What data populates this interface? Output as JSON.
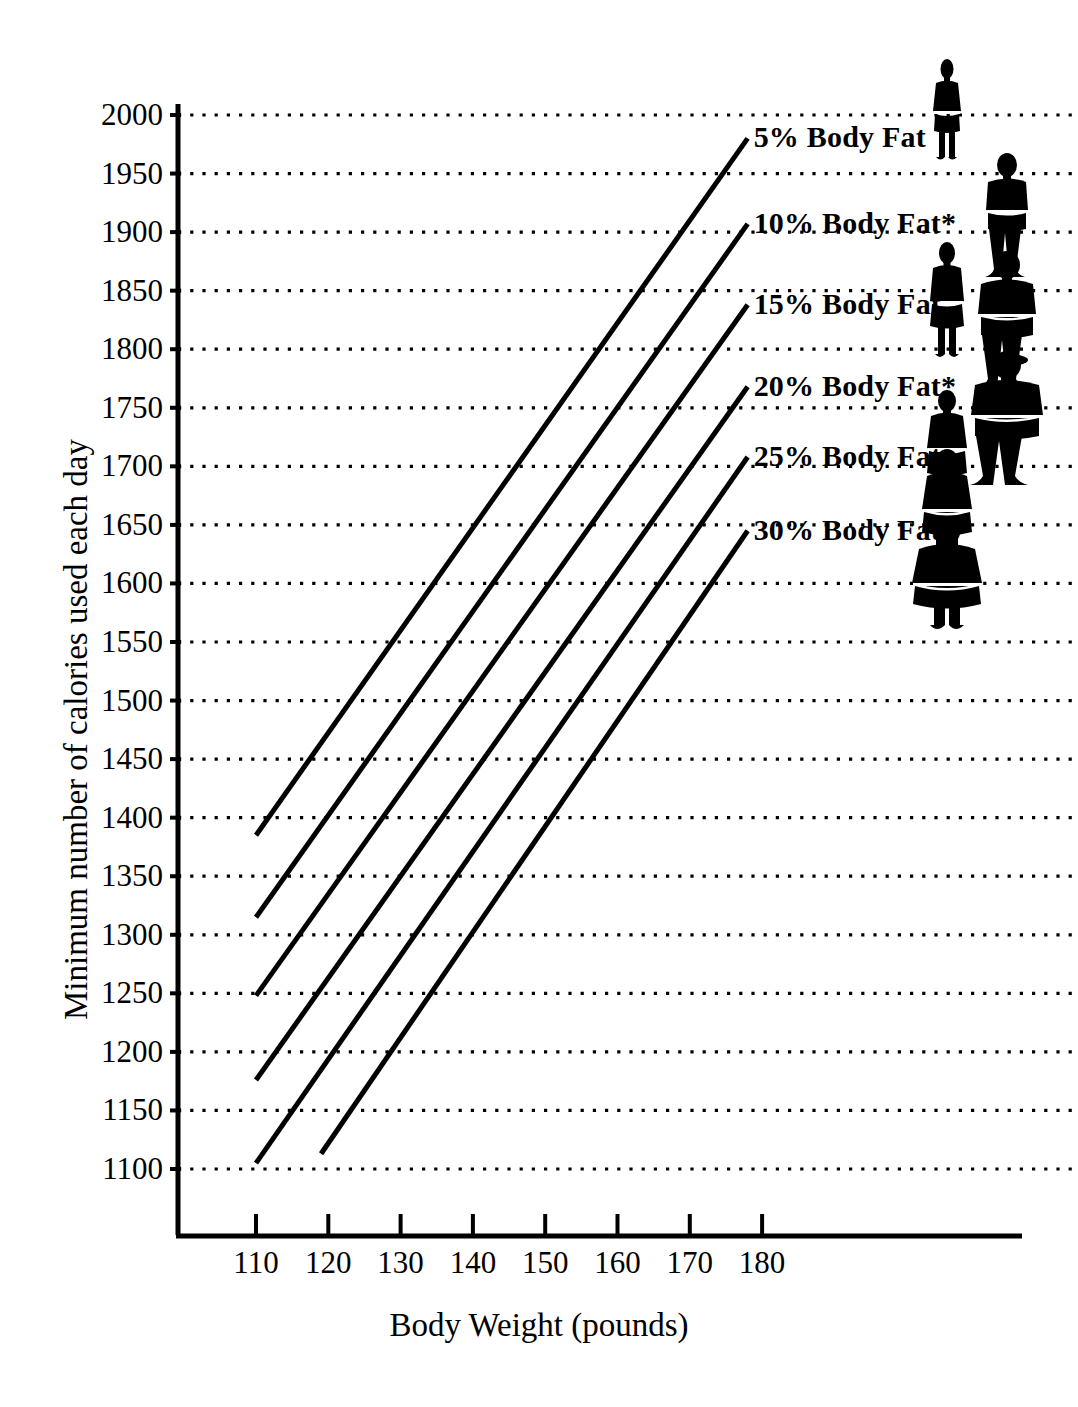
{
  "chart_data": {
    "type": "line",
    "title": "",
    "xlabel": "Body Weight (pounds)",
    "ylabel": "Minimum number of calories used each day",
    "xlim": [
      100,
      190
    ],
    "ylim": [
      1050,
      2025
    ],
    "xticks": [
      110,
      120,
      130,
      140,
      150,
      160,
      170,
      180
    ],
    "yticks": [
      1100,
      1150,
      1200,
      1250,
      1300,
      1350,
      1400,
      1450,
      1500,
      1550,
      1600,
      1650,
      1700,
      1750,
      1800,
      1850,
      1900,
      1950,
      2000
    ],
    "grid": "horizontal-dotted",
    "legend_position": "inline-right-of-lines",
    "series": [
      {
        "name": "5% Body Fat",
        "label": "5% Body Fat",
        "x": [
          110,
          178
        ],
        "values": [
          1385,
          1980
        ],
        "note": ""
      },
      {
        "name": "10% Body Fat",
        "label": "10% Body Fat*",
        "x": [
          110,
          178
        ],
        "values": [
          1315,
          1907
        ],
        "note": "asterisk"
      },
      {
        "name": "15% Body Fat",
        "label": "15% Body Fat",
        "x": [
          110,
          178
        ],
        "values": [
          1248,
          1838
        ],
        "note": ""
      },
      {
        "name": "20% Body Fat",
        "label": "20% Body Fat*",
        "x": [
          110,
          178
        ],
        "values": [
          1176,
          1768
        ],
        "note": "asterisk"
      },
      {
        "name": "25% Body Fat",
        "label": "25% Body Fat",
        "x": [
          110,
          178
        ],
        "values": [
          1105,
          1708
        ],
        "note": ""
      },
      {
        "name": "30% Body Fat",
        "label": "30% Body Fat",
        "x": [
          119,
          178
        ],
        "values": [
          1113,
          1645
        ],
        "note": ""
      }
    ],
    "annotations": [
      {
        "kind": "figure",
        "sex": "female",
        "body_fat": "5%",
        "width_class": 1
      },
      {
        "kind": "figure",
        "sex": "male",
        "body_fat": "10%",
        "width_class": 1
      },
      {
        "kind": "figure",
        "sex": "female",
        "body_fat": "15%",
        "width_class": 2
      },
      {
        "kind": "figure",
        "sex": "male",
        "body_fat": "20%",
        "width_class": 2
      },
      {
        "kind": "figure",
        "sex": "female",
        "body_fat": "20%",
        "width_class": 3
      },
      {
        "kind": "figure",
        "sex": "male",
        "body_fat": "25%",
        "width_class": 3
      },
      {
        "kind": "figure",
        "sex": "female",
        "body_fat": "25%",
        "width_class": 4
      },
      {
        "kind": "figure",
        "sex": "female",
        "body_fat": "30%",
        "width_class": 5
      }
    ]
  },
  "axes": {
    "x_title": "Body Weight (pounds)",
    "y_title": "Minimum number of calories used each day",
    "x_tick_labels": [
      "110",
      "120",
      "130",
      "140",
      "150",
      "160",
      "170",
      "180"
    ],
    "y_tick_labels": [
      "2000",
      "1950",
      "1900",
      "1850",
      "1800",
      "1750",
      "1700",
      "1650",
      "1600",
      "1550",
      "1500",
      "1450",
      "1400",
      "1350",
      "1300",
      "1250",
      "1200",
      "1150",
      "1100"
    ]
  },
  "legend": {
    "items": [
      "5% Body Fat",
      "10% Body Fat*",
      "15% Body Fat",
      "20% Body Fat*",
      "25% Body Fat",
      "30% Body Fat"
    ]
  },
  "style": {
    "background": "#ffffff",
    "ink": "#000000",
    "line_color": "#000000",
    "grid_color": "#000000"
  }
}
